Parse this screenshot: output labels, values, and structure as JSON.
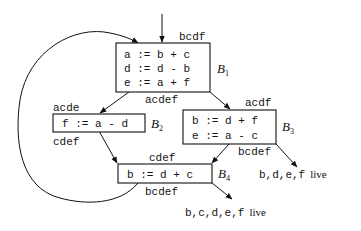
{
  "diagram": {
    "type": "control-flow-graph-liveness",
    "blocks": [
      {
        "id": "B1",
        "label": "B",
        "label_sub": "1",
        "statements": [
          "a := b + c",
          "d := d - b",
          "e := a + f"
        ],
        "live_in": "bcdf",
        "live_out": "acdef"
      },
      {
        "id": "B2",
        "label": "B",
        "label_sub": "2",
        "statements": [
          "f := a - d"
        ],
        "live_in": "acde",
        "live_out": "cdef"
      },
      {
        "id": "B3",
        "label": "B",
        "label_sub": "3",
        "statements": [
          "b := d + f",
          "e := a - c"
        ],
        "live_in": "acdf",
        "live_out": "bcdef"
      },
      {
        "id": "B4",
        "label": "B",
        "label_sub": "4",
        "statements": [
          "b := d + c"
        ],
        "live_in": "cdef",
        "live_out": "bcdef"
      }
    ],
    "exits": [
      {
        "from": "B3",
        "vars": "b,d,e,f",
        "suffix": "live"
      },
      {
        "from": "B4",
        "vars": "b,c,d,e,f",
        "suffix": "live"
      }
    ],
    "edges": [
      {
        "from": "entry",
        "to": "B1"
      },
      {
        "from": "B1",
        "to": "B2"
      },
      {
        "from": "B1",
        "to": "B3"
      },
      {
        "from": "B2",
        "to": "B4"
      },
      {
        "from": "B3",
        "to": "B4"
      },
      {
        "from": "B3",
        "to": "exit"
      },
      {
        "from": "B4",
        "to": "exit"
      },
      {
        "from": "B4",
        "to": "B1"
      }
    ]
  }
}
